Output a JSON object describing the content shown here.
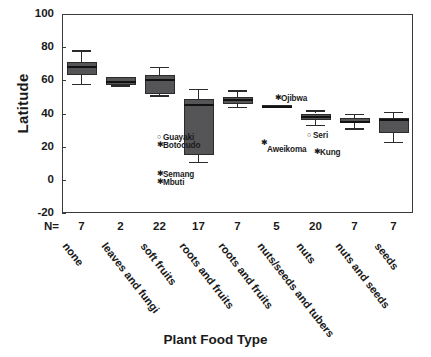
{
  "chart_data": {
    "type": "box",
    "title": "",
    "xlabel": "Plant Food Type",
    "ylabel": "Latitude",
    "ylim": [
      -20,
      100
    ],
    "yticks": [
      100,
      80,
      60,
      40,
      20,
      0,
      -20
    ],
    "grid": false,
    "legend": "none",
    "n_row_label": "N=",
    "categories": [
      "none",
      "leaves and fungi",
      "soft fruits",
      "roots and fruits",
      "roots and fruits",
      "nuts/seeds and tubers",
      "nuts",
      "nuts and seeds",
      "seeds"
    ],
    "n_values": [
      7,
      2,
      22,
      17,
      7,
      5,
      20,
      7,
      7
    ],
    "boxes": [
      {
        "category": "none",
        "whisker_low": 58,
        "q1": 63,
        "median": 68,
        "q3": 71,
        "whisker_high": 78
      },
      {
        "category": "leaves and fungi",
        "whisker_low": 57,
        "q1": 57,
        "median": 59,
        "q3": 62,
        "whisker_high": 62
      },
      {
        "category": "soft fruits",
        "whisker_low": 51,
        "q1": 52,
        "median": 60,
        "q3": 63,
        "whisker_high": 68
      },
      {
        "category": "roots and fruits",
        "whisker_low": 11,
        "q1": 15,
        "median": 45,
        "q3": 49,
        "whisker_high": 55
      },
      {
        "category": "roots and fruits",
        "whisker_low": 44,
        "q1": 46,
        "median": 48,
        "q3": 50,
        "whisker_high": 54
      },
      {
        "category": "nuts/seeds and tubers",
        "whisker_low": 44,
        "q1": 44,
        "median": 44,
        "q3": 45,
        "whisker_high": 45
      },
      {
        "category": "nuts",
        "whisker_low": 33,
        "q1": 36,
        "median": 38,
        "q3": 40,
        "whisker_high": 42
      },
      {
        "category": "nuts and seeds",
        "whisker_low": 31,
        "q1": 34,
        "median": 35,
        "q3": 37,
        "whisker_high": 40
      },
      {
        "category": "seeds",
        "whisker_low": 23,
        "q1": 28,
        "median": 36,
        "q3": 37,
        "whisker_high": 41
      }
    ],
    "outliers": [
      {
        "label": "Guayaki",
        "marker": "circle",
        "category": "roots and fruits",
        "value": 25
      },
      {
        "label": "Botocudo",
        "marker": "asterisk",
        "category": "roots and fruits",
        "value": 22
      },
      {
        "label": "Semang",
        "marker": "asterisk",
        "category": "roots and fruits",
        "value": 8
      },
      {
        "label": "Mbuti",
        "marker": "asterisk",
        "category": "roots and fruits",
        "value": 5
      },
      {
        "label": "Ojibwa",
        "marker": "asterisk",
        "category": "nuts/seeds and tubers",
        "value": 52
      },
      {
        "label": "Aweikoma",
        "marker": "asterisk",
        "category": "nuts/seeds and tubers",
        "value": 34
      },
      {
        "label": "Seri",
        "marker": "circle",
        "category": "nuts",
        "value": 30
      },
      {
        "label": "Kung",
        "marker": "asterisk",
        "category": "nuts",
        "value": 25
      }
    ],
    "colors": {
      "box_fill": "#555558",
      "box_line": "#2b2b2b",
      "median": "#111111",
      "axis": "#3a3a3a"
    }
  }
}
